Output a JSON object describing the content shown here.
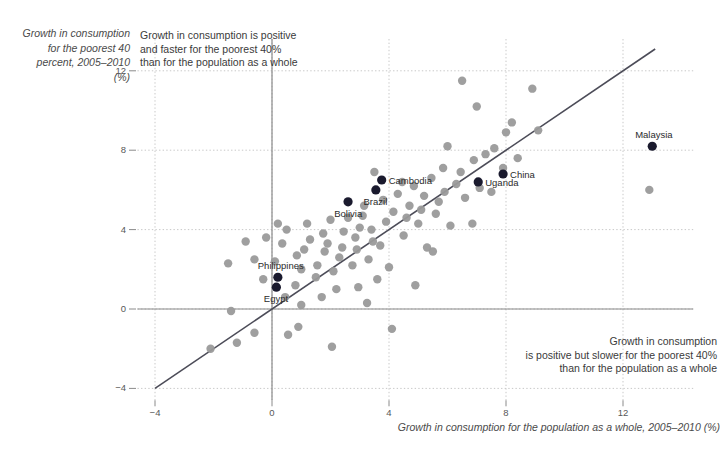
{
  "chart_data": {
    "type": "scatter",
    "title": "",
    "xlabel": "Growth in consumption for the population as a whole, 2005–2010 (%)",
    "ylabel": "Growth in consumption for the poorest 40 percent, 2005–2010 (%)",
    "xlim": [
      -4.6,
      14.4
    ],
    "ylim": [
      -4.6,
      13.6
    ],
    "xticks": [
      -4,
      0,
      4,
      8,
      12
    ],
    "yticks": [
      -4,
      0,
      4,
      8,
      12
    ],
    "grid": true,
    "legend": "none",
    "reference_line": {
      "label": "45-degree line (y = x)",
      "slope": 1,
      "intercept": 0,
      "x_start": -4.0,
      "x_end": 13.1,
      "color": "#4c4c58"
    },
    "annotations": [
      {
        "name": "above-line-note",
        "text": "Growth in consumption is positive and faster for the poorest 40% than for the population as a whole"
      },
      {
        "name": "below-line-note",
        "text": "Growth in consumption is positive but slower for the poorest 40% than for the population as a whole"
      }
    ],
    "series": [
      {
        "name": "Countries",
        "color": "#9a9a9a",
        "points": [
          {
            "x": -2.1,
            "y": -2.0
          },
          {
            "x": -1.2,
            "y": -1.7
          },
          {
            "x": -1.4,
            "y": -0.1
          },
          {
            "x": -0.6,
            "y": -1.2
          },
          {
            "x": -0.3,
            "y": 1.5
          },
          {
            "x": -0.6,
            "y": 2.5
          },
          {
            "x": -0.9,
            "y": 3.4
          },
          {
            "x": -1.5,
            "y": 2.3
          },
          {
            "x": -0.2,
            "y": 3.6
          },
          {
            "x": 0.1,
            "y": 2.4
          },
          {
            "x": 0.35,
            "y": 3.3
          },
          {
            "x": 0.5,
            "y": 4.0
          },
          {
            "x": 0.2,
            "y": 4.3
          },
          {
            "x": 0.55,
            "y": -1.3
          },
          {
            "x": 0.9,
            "y": -0.9
          },
          {
            "x": 1.0,
            "y": 0.2
          },
          {
            "x": 0.8,
            "y": 1.2
          },
          {
            "x": 1.0,
            "y": 2.0
          },
          {
            "x": 0.85,
            "y": 2.7
          },
          {
            "x": 1.1,
            "y": 3.0
          },
          {
            "x": 1.3,
            "y": 3.5
          },
          {
            "x": 1.2,
            "y": 4.3
          },
          {
            "x": 1.5,
            "y": 1.6
          },
          {
            "x": 1.7,
            "y": 0.6
          },
          {
            "x": 1.55,
            "y": 2.2
          },
          {
            "x": 1.8,
            "y": 2.9
          },
          {
            "x": 1.9,
            "y": 3.3
          },
          {
            "x": 1.75,
            "y": 3.8
          },
          {
            "x": 2.0,
            "y": 4.5
          },
          {
            "x": 2.1,
            "y": 1.9
          },
          {
            "x": 2.2,
            "y": 1.0
          },
          {
            "x": 2.3,
            "y": 2.6
          },
          {
            "x": 2.4,
            "y": 3.1
          },
          {
            "x": 2.45,
            "y": 3.9
          },
          {
            "x": 2.6,
            "y": 4.6
          },
          {
            "x": 2.75,
            "y": 2.2
          },
          {
            "x": 2.9,
            "y": 3.0
          },
          {
            "x": 2.85,
            "y": 3.6
          },
          {
            "x": 3.0,
            "y": 4.1
          },
          {
            "x": 3.1,
            "y": 4.7
          },
          {
            "x": 3.15,
            "y": 5.2
          },
          {
            "x": 3.3,
            "y": 2.5
          },
          {
            "x": 3.45,
            "y": 3.4
          },
          {
            "x": 3.4,
            "y": 4.0
          },
          {
            "x": 3.5,
            "y": 6.9
          },
          {
            "x": 3.6,
            "y": 1.5
          },
          {
            "x": 3.7,
            "y": 3.2
          },
          {
            "x": 3.8,
            "y": 5.5
          },
          {
            "x": 3.9,
            "y": 4.4
          },
          {
            "x": 4.0,
            "y": 2.1
          },
          {
            "x": 4.1,
            "y": -1.0
          },
          {
            "x": 4.15,
            "y": 4.9
          },
          {
            "x": 4.3,
            "y": 5.8
          },
          {
            "x": 4.45,
            "y": 6.4
          },
          {
            "x": 4.5,
            "y": 3.7
          },
          {
            "x": 4.6,
            "y": 4.6
          },
          {
            "x": 4.7,
            "y": 5.2
          },
          {
            "x": 4.85,
            "y": 6.2
          },
          {
            "x": 5.0,
            "y": 4.3
          },
          {
            "x": 5.1,
            "y": 5.0
          },
          {
            "x": 5.2,
            "y": 5.7
          },
          {
            "x": 5.3,
            "y": 3.1
          },
          {
            "x": 5.45,
            "y": 6.6
          },
          {
            "x": 5.6,
            "y": 4.8
          },
          {
            "x": 5.7,
            "y": 5.4
          },
          {
            "x": 5.9,
            "y": 5.9
          },
          {
            "x": 5.85,
            "y": 7.1
          },
          {
            "x": 6.0,
            "y": 8.2
          },
          {
            "x": 6.1,
            "y": 4.2
          },
          {
            "x": 6.3,
            "y": 6.3
          },
          {
            "x": 6.45,
            "y": 6.9
          },
          {
            "x": 6.5,
            "y": 11.5
          },
          {
            "x": 6.6,
            "y": 5.6
          },
          {
            "x": 6.9,
            "y": 7.5
          },
          {
            "x": 7.0,
            "y": 10.2
          },
          {
            "x": 7.1,
            "y": 6.1
          },
          {
            "x": 7.3,
            "y": 7.8
          },
          {
            "x": 7.5,
            "y": 5.9
          },
          {
            "x": 7.6,
            "y": 8.1
          },
          {
            "x": 7.9,
            "y": 7.1
          },
          {
            "x": 8.0,
            "y": 8.9
          },
          {
            "x": 8.2,
            "y": 9.4
          },
          {
            "x": 8.4,
            "y": 7.6
          },
          {
            "x": 8.9,
            "y": 11.1
          },
          {
            "x": 9.1,
            "y": 9.0
          },
          {
            "x": 5.5,
            "y": 2.9
          },
          {
            "x": 4.9,
            "y": 1.2
          },
          {
            "x": 3.25,
            "y": 0.3
          },
          {
            "x": 2.05,
            "y": -1.9
          },
          {
            "x": 12.9,
            "y": 6.0
          },
          {
            "x": 0.45,
            "y": 0.6
          },
          {
            "x": 6.85,
            "y": 4.3
          },
          {
            "x": 2.95,
            "y": 1.1
          }
        ]
      },
      {
        "name": "Highlighted countries",
        "color": "#1a1a2e",
        "points": [
          {
            "x": 0.15,
            "y": 1.1,
            "label": "Egypt",
            "label_pos": "below"
          },
          {
            "x": 0.2,
            "y": 1.6,
            "label": "Philippines",
            "label_pos": "above"
          },
          {
            "x": 2.6,
            "y": 5.4,
            "label": "Bolivia",
            "label_pos": "below"
          },
          {
            "x": 3.55,
            "y": 6.0,
            "label": "Brazil",
            "label_pos": "below"
          },
          {
            "x": 3.75,
            "y": 6.5,
            "label": "Cambodia",
            "label_pos": "right"
          },
          {
            "x": 7.05,
            "y": 6.4,
            "label": "Uganda",
            "label_pos": "right"
          },
          {
            "x": 7.9,
            "y": 6.8,
            "label": "China",
            "label_pos": "right"
          },
          {
            "x": 13.0,
            "y": 8.2,
            "label": "Malaysia",
            "label_pos": "above"
          }
        ]
      }
    ]
  },
  "axes": {
    "x_tick_labels": [
      "-4",
      "0",
      "4",
      "8",
      "12"
    ],
    "y_tick_labels": [
      "-4",
      "0",
      "4",
      "8",
      "12"
    ],
    "x_title": "Growth in consumption for the population as a whole, 2005–2010 (%)",
    "y_title_lines": [
      "Growth in consumption",
      "for the poorest 40",
      "percent, 2005–2010",
      "(%)"
    ]
  },
  "annotations": {
    "top_lines": [
      "Growth in consumption is positive",
      "and faster for the poorest 40%",
      "than for the population as a whole"
    ],
    "bottom_lines": [
      "Growth in consumption",
      "is positive but slower for the poorest 40%",
      "than for the population as a whole"
    ]
  },
  "colors": {
    "background": "#ffffff",
    "point": "#9a9a9a",
    "point_highlight": "#1a1a2e",
    "axis": "#8a8a8a",
    "grid": "#c8c8c8",
    "line": "#4c4c58",
    "text": "#3a3a3a"
  }
}
